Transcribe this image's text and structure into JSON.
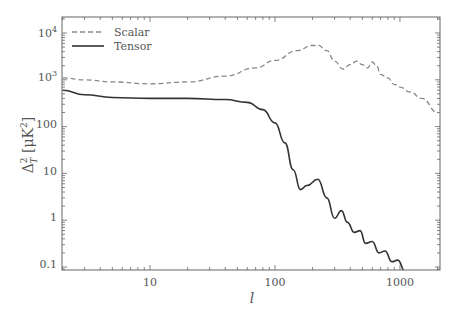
{
  "chart_data": {
    "type": "line",
    "title": "",
    "xlabel": "l",
    "ylabel": "Δ_T^2 [μK^2]",
    "xscale": "log",
    "yscale": "log",
    "xlim": [
      2,
      2000
    ],
    "ylim": [
      0.07,
      20000
    ],
    "grid": false,
    "legend_position": "upper left",
    "x_ticks": [
      "10",
      "100",
      "1000"
    ],
    "y_ticks": [
      "0.1",
      "1",
      "10",
      "100",
      "10^3",
      "10^4"
    ],
    "series": [
      {
        "name": "Scalar",
        "style": "dashed",
        "color": "#888888",
        "x": [
          2,
          3,
          5,
          10,
          20,
          40,
          70,
          100,
          150,
          200,
          220,
          260,
          300,
          350,
          400,
          450,
          500,
          550,
          600,
          650,
          700,
          800,
          900,
          1000,
          1200,
          1500,
          2000
        ],
        "values": [
          1100,
          1000,
          900,
          820,
          900,
          1200,
          1800,
          2600,
          4200,
          5400,
          5500,
          4200,
          2500,
          1700,
          2100,
          2500,
          2100,
          1800,
          2400,
          2000,
          1300,
          1100,
          800,
          700,
          550,
          400,
          200
        ]
      },
      {
        "name": "Tensor",
        "style": "solid",
        "color": "#333333",
        "x": [
          2,
          3,
          5,
          10,
          20,
          40,
          60,
          80,
          100,
          120,
          140,
          160,
          180,
          220,
          260,
          300,
          340,
          380,
          430,
          480,
          530,
          600,
          680,
          760,
          860,
          960,
          1100,
          1250
        ],
        "values": [
          600,
          480,
          420,
          400,
          400,
          380,
          330,
          230,
          120,
          45,
          12,
          4.5,
          5.5,
          7.5,
          3.0,
          1.1,
          1.6,
          0.9,
          0.55,
          0.6,
          0.32,
          0.35,
          0.2,
          0.22,
          0.13,
          0.14,
          0.08,
          0.07
        ]
      }
    ]
  },
  "legend": {
    "scalar": "Scalar",
    "tensor": "Tensor"
  },
  "axes": {
    "xlabel": "l",
    "ylabel_main": "Δ",
    "ylabel_unit": "[μK",
    "x_ticks": [
      "10",
      "100",
      "1000"
    ],
    "y_ticks": [
      "0.1",
      "1",
      "10",
      "100"
    ]
  }
}
